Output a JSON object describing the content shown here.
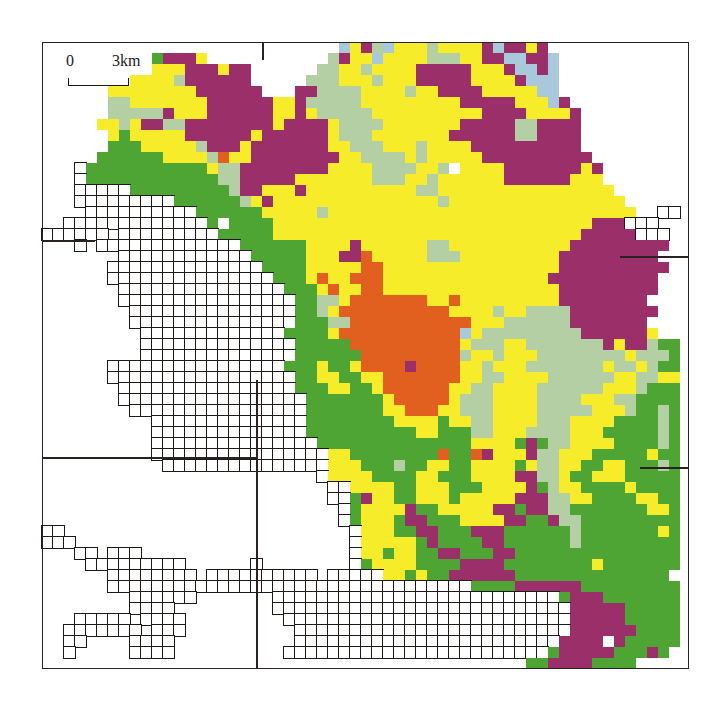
{
  "map": {
    "frame": {
      "left": 42,
      "top": 42,
      "right": 688,
      "bottom": 668
    },
    "scale_bar": {
      "start_label": "0",
      "end_label": "3km"
    },
    "grid": {
      "origin_x": 42,
      "origin_y": 42,
      "cell_size": 11
    },
    "legend_colors": {
      "G": "#4ea533",
      "Y": "#f7ec2a",
      "P": "#9a2f6a",
      "O": "#e2601f",
      "S": "#b3cfa3",
      "B": "#a8c8dc",
      "W": "#ffffff"
    },
    "divider_lines": [
      {
        "x1": 262,
        "y1": 42,
        "x2": 262,
        "y2": 60
      },
      {
        "x1": 42,
        "y1": 240,
        "x2": 95,
        "y2": 240
      },
      {
        "x1": 42,
        "y1": 457,
        "x2": 256,
        "y2": 457
      },
      {
        "x1": 256,
        "y1": 380,
        "x2": 256,
        "y2": 668
      },
      {
        "x1": 620,
        "y1": 256,
        "x2": 688,
        "y2": 256
      },
      {
        "x1": 640,
        "y1": 467,
        "x2": 688,
        "y2": 467
      }
    ],
    "rows": [
      "...........................BYPSBYYYSYYYYPBPPYP...........",
      "..........GPPPY...........SPYYBYYYYSSSYYPPBBPPB..........",
      "..........YYYPPPYPP......SSYYSYYYYPPPPPYYYPBBPB..........",
      "........YYYYSPPPPPP.....SSSYYYSYYYPPPPPYYYYPBBB..........",
      "......YYYYYYYYPPPPPP...PPSSSSYYYYSYYPPPPYYYYYBB..........",
      "......SSYYYYYYYPPPPPPYYPSSSSSYYYYYYYYYPPPPPYYYBP..........",
      "......SSSSSPYYYPPPPPPYYPYSSSSSYYYYYYYYYYPPPPYYYYP..........",
      ".....YYSYPPSSPPPPPPPPYPPPPYSSSSYYYYYYYPPPPPSSPPPP..........",
      "......YGYYYYYPPPPPPYPPPPPPYSSSYYYYYYYPPPPPPSSPPPP..........",
      "......GGGYYYYYSPPPYPPPPPPPYYSSSYYYSYYYYPPPPPPPPPP..........",
      ".....GGGGGGYYYYSOYYPPPPPPPPYYSSSSYSYYYYYPPPPPPPPPP.........",
      "...#GGGGGGGGGGGYSSPPPPPPPPYYYYSSSSYYSWYYYYPPPPPPPYP.........",
      "...#GGGGGGGGGGGGSSPPPPPYYYYYYYSSSYYSYYYYYYPPPPPPYYY.........",
      "...#####GGGGGGGGGSPPYYYPYYYYYYYYYYSSYYYYYYYYYYYYYYYY........",
      "...#########GGGGGGSYPYYYYYYYYYYYYYYYSYYYYYYYYYYYYYYYY........",
      "....##########GGGGGGYYYYYSYYYYYYYYYYYYYYYYYYYYYYYYYYYY..##...",
      "..#############GWGGGGYYYYYYYYYYYYYYYYYYYYYYYYYYYYYPPP###...",
      "######.#########GGGGGYYYYYYYYYYYYYYYYYYYYYYYYYYYYPPPPP###...",
      "...#.#############GGGGGGYYYYPYYYYYYSSYYYYYYYYYYYPPPPPPPPP....",
      ".......############GGGGGYYYPPOYYYYYSSSYYYYYYYYYPPPPPPPPP....",
      "......##############GGGGYYYYYOOYYYYYYYYYYYYYYYYPPPPPPPPPP....",
      "......###############GGGYOYYOOOYYYYYYYYYYYYYYYPPPPPPPPPP....",
      ".......###############GGGYOYYOOYYYYYYYYYYYYYYYYPPPPPPPPP....",
      ".......################GGSSYOOOOOOOYYOYYYYYYYYYPPPPPPPP.....",
      "........###############GGSYOOOOOOOOOOYYYYSYYSSSSPPPPPPPP....",
      "........###############GGGSSOOOOOOOOOOOYYYSSSSSSPPPPPPP.....",
      ".........#############GGGGYOOOOOOOOOOOBYSSSSSSSSSPPPPPPY....",
      ".........##############GGGGGOOOOOOOOOOYSSSYYSSSSSSSPYPPSGG..",
      ".........##############GGGGGGOOOOOOOOOSYYSYYYSSSSSSSSYSSSGG.",
      "......################GGGYGGYOOOOPOOOOYYSYYYSSSSSSSYSSYSGG.",
      "......#################GGYYGGYYOOOOOOOYYSSYYYYSSSSSSYYSSYYG.",
      ".......################GGGYYGGYOOOOOOYYSSYYYYSSSSSSYYYSGGG.",
      ".......#################GGGGGGGYOOOOOYSSSYYYYSSSSYYYSSGGGGY.",
      "........################GGGGGGGYYOOOYYSSSYYYYSSSSSYYYSGGSG.",
      "..........##############GGGGGGGGYYYYGYYSSYYYYSSSYYYYGGGGSG.",
      "..........##############GGGGGGGGGGYYGGGSSYYYSSSSYYYGGGGGSGP.",
      "..........###############GGGGGGGGGGGGGGYYYYGPGSSYYYYGGGGSGP.",
      "..........################YYGGGGGGGGOGGOPYYYPSSYYYGGGGGYGG.",
      "...........###############YYYGGGSGGYYGGYYYYGYSSYYGGYYGGGSGG.",
      ".........................#YYYYGGGGYYGGGYYYYPPSSYGGYYYGGGGGG.",
      "..........................##YYYYGGYYYGGGYYYYPGSYYGGGGYGGGGG.",
      "..........................##GPYYGGYYYGYYYYYPPPSSYYGGGGYYGGGG.",
      "...........................#GYYYYPGGYYYYYPPGPPSSGGGGGGGYYGG..",
      "...........................#GYYYGPPGGGYYYYPPGGPSSGGGGGGGGGGG..",
      "##..........................#YYYGGPPGGGPPPGGGGGGSGGGGGGGYGG...",
      "###.........................#YYYYYGPGGGGPPGGGGGGSGGGGGGGGGG...",
      "...##.###...................#YYGYYGGPPGGGPPGGGGGGGGGGGGGGGYG...",
      "....#########......#........#GYYYYGGGGPPPPGGGGGGGGYGGGGGGGG...",
      "......########.##########.#####YYGYGGPPPPPPGGGGGGGGGGGGGG....",
      "......#################################GGGGPPPPPPGGGGGGGGGGG....",
      "........######.......##########################GPPPGGGGGGGGGGG....",
      "........####.........###########################PPPPPGGGGGGGSGG.....",
      "...#####.####.........##########################PPPPPGGGGGGGGG......",
      "..#######.###..........#########################PPPPPPGGGGGGG......",
      "..##....####...........########################PPPPWPGGGGG........",
      "..#.....####..........########################GPPPPPGGGPG........",
      "............................................GGPPPPGGGG..........."
    ]
  }
}
